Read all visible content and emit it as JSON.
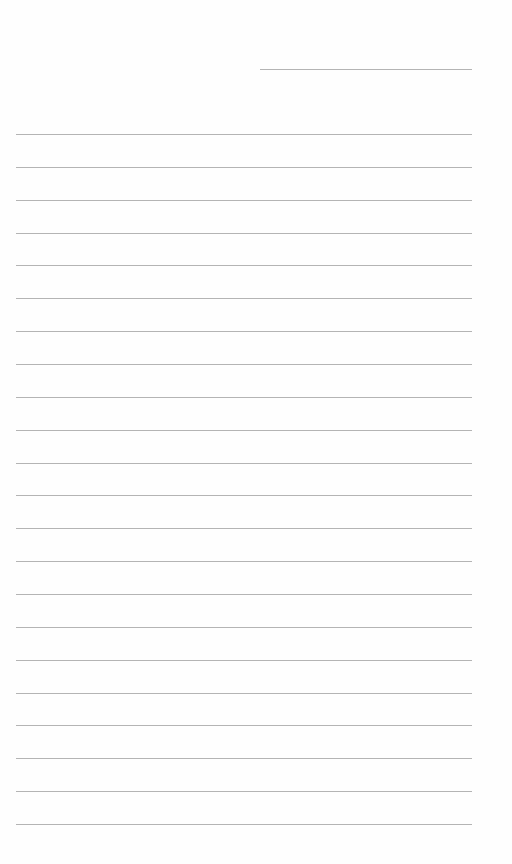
{
  "page": {
    "type": "lined-paper",
    "background_color": "#fefefe",
    "line_color": "#b4b4b4",
    "header_line": {
      "x_start": 260,
      "x_end": 472,
      "y": 69
    },
    "ruled_lines": {
      "count": 22,
      "x_start": 16,
      "x_end": 472,
      "first_y": 134,
      "spacing": 32.86
    }
  }
}
